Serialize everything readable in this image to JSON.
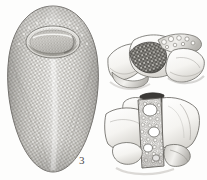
{
  "plate": {
    "type": "scientific-illustration-plate",
    "medium": "engraving / stipple drawing",
    "background_color": "#fdfdfc",
    "ink_color": "#4a4a4a",
    "width_px": 207,
    "height_px": 180,
    "figure_count": 2
  },
  "figures": [
    {
      "number": "3",
      "label": "3",
      "label_position": {
        "x": 75,
        "y": 151
      },
      "description": "Elongate ovoid specimen, apex uppermost, with a deep cup-like oral aperture at the summit; entire outer wall covered with dense granular reticulate ornament; tapering to a rounded base",
      "position": {
        "x": 4,
        "y": 4,
        "width": 98,
        "height": 172
      },
      "shading": "dense stipple with darker left margin and highlight down the median line",
      "fill_color": "#b9b7b2",
      "outline_color": "#5a5956",
      "texture": "granular-reticulate"
    },
    {
      "number": "4",
      "label": "4",
      "label_position": {
        "x": 180,
        "y": 150
      },
      "description": "Two views of a vertebral / skeletal element; upper view oblique showing a dark excavated cancellous patch, lower view lateral showing a vertical column of open reticulate (spongy) tissue flanked by smooth bone surfaces",
      "position": {
        "x": 104,
        "y": 6,
        "width": 102,
        "height": 172
      },
      "views": [
        {
          "name": "upper-oblique-view",
          "position": {
            "x": 110,
            "y": 10,
            "width": 95,
            "height": 72
          },
          "detail": "dark granular excavation at centre, smooth wing-like processes left and right",
          "fill_color": "#f4f3f1",
          "dark_patch_color": "#5d5b57"
        },
        {
          "name": "lower-lateral-view",
          "position": {
            "x": 110,
            "y": 86,
            "width": 95,
            "height": 88
          },
          "detail": "central vertical band of open cellular/spongy texture, smooth plates to each side, rounded condyle-like bosses below",
          "fill_color": "#f6f5f3",
          "reticulum_color": "#6b6964"
        }
      ],
      "outline_color": "#5a5956"
    }
  ],
  "colors": {
    "paper": "#fdfdfc",
    "ink_dark": "#4a4a4a",
    "ink_mid": "#8b8984",
    "ink_light": "#c9c7c2",
    "specimen_body": "#b9b7b2",
    "specimen_light": "#f4f3f1"
  }
}
